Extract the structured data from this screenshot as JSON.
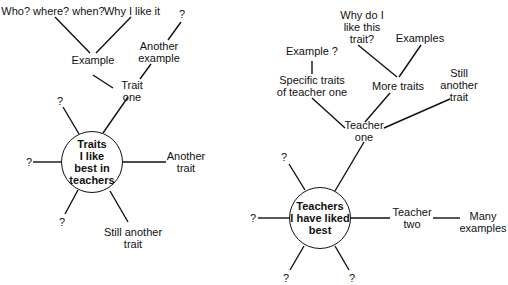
{
  "left_map": {
    "center": "Traits\nI like\nbest in\nteachers",
    "nodes": {
      "trait_one": "Trait\none",
      "example": "Example",
      "who_where_when": "Who? where? when?",
      "why_i_like_it": "Why I like it",
      "another_example": "Another\nexample",
      "another_example_q": "?",
      "another_trait": "Another\ntrait",
      "still_another_trait": "Still another\ntrait",
      "q_upper_left": "?",
      "q_left": "?",
      "q_lower_left": "?"
    }
  },
  "right_map": {
    "center": "Teachers\nI have liked\nbest",
    "nodes": {
      "teacher_one": "Teacher\none",
      "specific_traits": "Specific traits\nof teacher one",
      "example_q": "Example ?",
      "more_traits": "More traits",
      "why_do_i_like": "Why do I\nlike this\ntrait?",
      "examples": "Examples",
      "still_another_trait": "Still another\ntrait",
      "teacher_two": "Teacher\ntwo",
      "many_examples": "Many\nexamples",
      "q_upper_left": "?",
      "q_left": "?",
      "q_lower_left": "?",
      "q_lower_right": "?"
    }
  },
  "colors": {
    "line": "#111111",
    "background": "#ffffff"
  }
}
